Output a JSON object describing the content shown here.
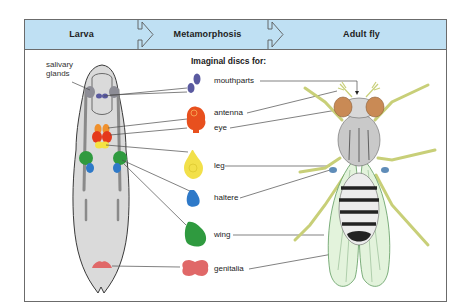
{
  "figure": {
    "stages": [
      {
        "label": "Larva"
      },
      {
        "label": "Metamorphosis"
      },
      {
        "label": "Adult fly"
      }
    ],
    "discs_title": "Imaginal discs for:",
    "larva_label": "salivary\nglands",
    "larva_label_lines": [
      "salivary",
      "glands"
    ],
    "discs": [
      {
        "label": "mouthparts",
        "color": "#5a5aa0"
      },
      {
        "label": "antenna",
        "color": "#e8501e"
      },
      {
        "label": "eye",
        "color": "#e8501e"
      },
      {
        "label": "leg",
        "color": "#f2e04a"
      },
      {
        "label": "haltere",
        "color": "#2e79c8"
      },
      {
        "label": "wing",
        "color": "#2f9a3f"
      },
      {
        "label": "genitalia",
        "color": "#e06868"
      }
    ],
    "colors": {
      "banner": "#bfe0f3",
      "frame": "#6b6b6b",
      "larva_body": "#dadada",
      "fly_legs": "#c8cf78",
      "fly_wings": "#e3f3dc",
      "fly_eyes": "#c98a55"
    }
  }
}
